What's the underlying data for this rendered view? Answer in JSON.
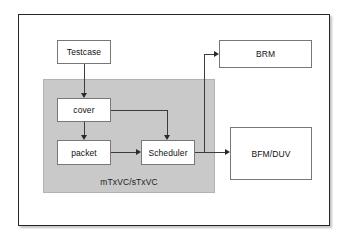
{
  "diagram": {
    "panel": {
      "label": "mTxVC/sTxVC",
      "fill_color": "#c9c9c9",
      "border_color": "#b2b2b2"
    },
    "frame": {
      "border_color": "#262626",
      "background": "#ffffff"
    },
    "nodes": [
      {
        "id": "testcase",
        "label": "Testcase",
        "inside_panel": false
      },
      {
        "id": "cover",
        "label": "cover",
        "inside_panel": true
      },
      {
        "id": "packet",
        "label": "packet",
        "inside_panel": true
      },
      {
        "id": "scheduler",
        "label": "Scheduler",
        "inside_panel": true
      },
      {
        "id": "brm",
        "label": "BRM",
        "inside_panel": false
      },
      {
        "id": "bfm_duv",
        "label": "BFM/DUV",
        "inside_panel": false
      }
    ],
    "edges": [
      {
        "from": "testcase",
        "to": "cover",
        "style": "arrow"
      },
      {
        "from": "cover",
        "to": "packet",
        "style": "arrow"
      },
      {
        "from": "cover",
        "to": "scheduler",
        "style": "arrow"
      },
      {
        "from": "packet",
        "to": "scheduler",
        "style": "arrow"
      },
      {
        "from": "scheduler",
        "to": "brm",
        "style": "arrow"
      },
      {
        "from": "scheduler",
        "to": "bfm_duv",
        "style": "arrow"
      }
    ],
    "line_color": "#3c3c3c",
    "arrow_color": "#2a2a2a",
    "node_border_color": "#777777",
    "text_color": "#111111"
  }
}
